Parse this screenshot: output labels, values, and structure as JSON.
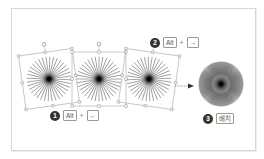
{
  "figure": {
    "colors": {
      "frame_border": "#d6d6d6",
      "bbox": "#a6a6a6",
      "rays": "#6b6b6b",
      "badge": "#333333",
      "arrow": "#444444"
    },
    "shapes": [
      {
        "id": "left",
        "rotation_deg": -8,
        "cx": 49,
        "cy": 79
      },
      {
        "id": "middle",
        "rotation_deg": 0,
        "cx": 99,
        "cy": 79
      },
      {
        "id": "right",
        "rotation_deg": 8,
        "cx": 149,
        "cy": 79
      }
    ],
    "result": {
      "cx": 221,
      "cy": 84
    }
  },
  "steps": [
    {
      "number": "1",
      "key": "Alt",
      "plus": "+",
      "arrow_key": "←"
    },
    {
      "number": "2",
      "key": "Alt",
      "plus": "+",
      "arrow_key": "→"
    },
    {
      "number": "3",
      "label": "배치"
    }
  ]
}
